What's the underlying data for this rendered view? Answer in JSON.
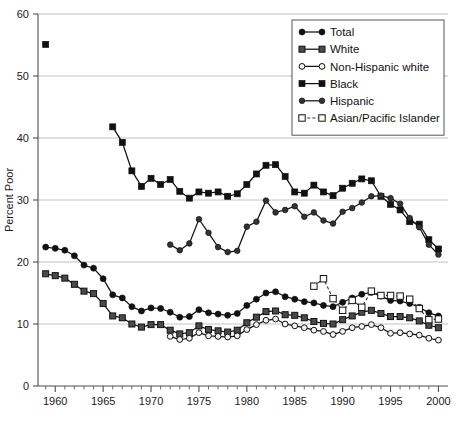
{
  "chart_data": {
    "type": "line",
    "title": "",
    "xlabel": "",
    "ylabel": "Percent Poor",
    "xlim": [
      1958.2,
      2001.0
    ],
    "ylim": [
      0,
      60
    ],
    "yticks": [
      0,
      10,
      20,
      30,
      40,
      50,
      60
    ],
    "ytick_labels": [
      "0",
      "10",
      "20",
      "30",
      "40",
      "50",
      "60"
    ],
    "xticks": [
      1960,
      1965,
      1970,
      1975,
      1980,
      1985,
      1990,
      1995,
      2000
    ],
    "xtick_labels": [
      "1960",
      "1965",
      "1970",
      "1975",
      "1980",
      "1985",
      "1990",
      "1995",
      "2000"
    ],
    "minor_xtick_step": 1,
    "grid": "horizontal",
    "legend_position": "top-right",
    "legend_entries": [
      {
        "label": "Total",
        "marker": "filled-circle",
        "line": "solid",
        "color": "#111111"
      },
      {
        "label": "White",
        "marker": "filled-square-dark",
        "line": "solid",
        "color": "#111111"
      },
      {
        "label": "Non-Hispanic white",
        "marker": "open-circle",
        "line": "solid",
        "color": "#111111"
      },
      {
        "label": "Black",
        "marker": "filled-square",
        "line": "solid",
        "color": "#111111"
      },
      {
        "label": "Hispanic",
        "marker": "filled-circle-small",
        "line": "solid",
        "color": "#111111"
      },
      {
        "label": "Asian/Pacific Islander",
        "marker": "open-square",
        "line": "dashed",
        "color": "#333333"
      }
    ],
    "series": [
      {
        "name": "Total",
        "marker": "filled-circle",
        "line": "solid",
        "x": [
          1959,
          1960,
          1961,
          1962,
          1963,
          1964,
          1965,
          1966,
          1967,
          1968,
          1969,
          1970,
          1971,
          1972,
          1973,
          1974,
          1975,
          1976,
          1977,
          1978,
          1979,
          1980,
          1981,
          1982,
          1983,
          1984,
          1985,
          1986,
          1987,
          1988,
          1989,
          1990,
          1991,
          1992,
          1993,
          1994,
          1995,
          1996,
          1997,
          1998,
          1999,
          2000
        ],
        "values": [
          22.4,
          22.2,
          21.9,
          21.0,
          19.5,
          19.0,
          17.3,
          14.7,
          14.2,
          12.8,
          12.1,
          12.6,
          12.5,
          11.9,
          11.1,
          11.2,
          12.3,
          11.8,
          11.6,
          11.4,
          11.7,
          13.0,
          14.0,
          15.0,
          15.2,
          14.4,
          14.0,
          13.6,
          13.4,
          13.0,
          12.8,
          13.5,
          14.2,
          14.8,
          15.1,
          14.5,
          13.8,
          13.7,
          13.3,
          12.7,
          11.8,
          11.3
        ]
      },
      {
        "name": "White",
        "marker": "filled-square-dark",
        "line": "solid",
        "x": [
          1959,
          1960,
          1961,
          1962,
          1963,
          1964,
          1965,
          1966,
          1967,
          1968,
          1969,
          1970,
          1971,
          1972,
          1973,
          1974,
          1975,
          1976,
          1977,
          1978,
          1979,
          1980,
          1981,
          1982,
          1983,
          1984,
          1985,
          1986,
          1987,
          1988,
          1989,
          1990,
          1991,
          1992,
          1993,
          1994,
          1995,
          1996,
          1997,
          1998,
          1999,
          2000
        ],
        "values": [
          18.1,
          17.8,
          17.4,
          16.4,
          15.3,
          14.9,
          13.3,
          11.3,
          11.0,
          10.0,
          9.5,
          9.9,
          9.9,
          9.0,
          8.4,
          8.6,
          9.7,
          9.1,
          8.9,
          8.7,
          9.0,
          10.2,
          11.1,
          12.0,
          12.1,
          11.5,
          11.4,
          11.0,
          10.4,
          10.1,
          10.0,
          10.7,
          11.3,
          11.9,
          12.2,
          11.7,
          11.2,
          11.2,
          11.0,
          10.5,
          9.8,
          9.4
        ]
      },
      {
        "name": "Non-Hispanic white",
        "marker": "open-circle",
        "line": "solid",
        "x": [
          1972,
          1973,
          1974,
          1975,
          1976,
          1977,
          1978,
          1979,
          1980,
          1981,
          1982,
          1983,
          1984,
          1985,
          1986,
          1987,
          1988,
          1989,
          1990,
          1991,
          1992,
          1993,
          1994,
          1995,
          1996,
          1997,
          1998,
          1999,
          2000
        ],
        "values": [
          8.0,
          7.5,
          7.7,
          8.6,
          8.1,
          8.0,
          7.9,
          8.1,
          9.1,
          9.9,
          10.6,
          10.8,
          10.0,
          9.7,
          9.4,
          9.0,
          8.8,
          8.3,
          8.8,
          9.4,
          9.6,
          9.9,
          9.4,
          8.5,
          8.6,
          8.4,
          8.2,
          7.7,
          7.4
        ]
      },
      {
        "name": "Black",
        "marker": "filled-square",
        "line": "solid",
        "x": [
          1959,
          1966,
          1967,
          1968,
          1969,
          1970,
          1971,
          1972,
          1973,
          1974,
          1975,
          1976,
          1977,
          1978,
          1979,
          1980,
          1981,
          1982,
          1983,
          1984,
          1985,
          1986,
          1987,
          1988,
          1989,
          1990,
          1991,
          1992,
          1993,
          1994,
          1995,
          1996,
          1997,
          1998,
          1999,
          2000
        ],
        "values": [
          55.1,
          41.8,
          39.3,
          34.7,
          32.2,
          33.5,
          32.5,
          33.3,
          31.4,
          30.3,
          31.3,
          31.1,
          31.3,
          30.6,
          31.0,
          32.5,
          34.2,
          35.6,
          35.7,
          33.8,
          31.3,
          31.1,
          32.4,
          31.3,
          30.7,
          31.9,
          32.7,
          33.4,
          33.1,
          30.6,
          29.3,
          28.4,
          26.5,
          26.1,
          23.6,
          22.1
        ]
      },
      {
        "name": "Hispanic",
        "marker": "filled-circle-small",
        "line": "solid",
        "x": [
          1972,
          1973,
          1974,
          1975,
          1976,
          1977,
          1978,
          1979,
          1980,
          1981,
          1982,
          1983,
          1984,
          1985,
          1986,
          1987,
          1988,
          1989,
          1990,
          1991,
          1992,
          1993,
          1994,
          1995,
          1996,
          1997,
          1998,
          1999,
          2000
        ],
        "values": [
          22.8,
          21.9,
          23.0,
          26.9,
          24.7,
          22.4,
          21.6,
          21.8,
          25.7,
          26.5,
          29.9,
          28.0,
          28.4,
          29.0,
          27.3,
          28.0,
          26.7,
          26.2,
          28.1,
          28.7,
          29.6,
          30.6,
          30.7,
          30.3,
          29.4,
          27.1,
          25.6,
          22.8,
          21.2
        ]
      },
      {
        "name": "Asian/Pacific Islander",
        "marker": "open-square",
        "line": "dashed",
        "x": [
          1987,
          1988,
          1989,
          1990,
          1991,
          1992,
          1993,
          1994,
          1995,
          1996,
          1997,
          1998,
          1999,
          2000
        ],
        "values": [
          16.1,
          17.3,
          14.1,
          12.2,
          13.8,
          12.7,
          15.3,
          14.6,
          14.6,
          14.5,
          14.0,
          12.5,
          10.7,
          10.8
        ]
      }
    ]
  },
  "axes": {
    "y_title": "Percent Poor"
  }
}
